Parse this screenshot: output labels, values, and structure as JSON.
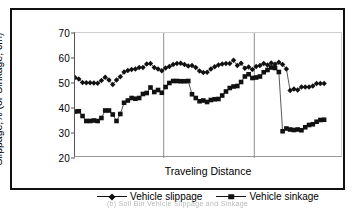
{
  "chart_data": {
    "type": "line",
    "title": "",
    "xlabel": "Traveling Distance",
    "ylabel": "Slippage,% (or Sinkage, cm)",
    "ylim": [
      20,
      70
    ],
    "yticks": [
      20,
      30,
      40,
      50,
      60,
      70
    ],
    "xlim": [
      0,
      71
    ],
    "xticks": [],
    "grid": false,
    "legend_position": "bottom-center",
    "vertical_dividers": [
      23.5,
      47.5
    ],
    "series": [
      {
        "name": "Vehicle slippage",
        "marker": "diamond",
        "color": "#111111",
        "values": [
          52.2,
          51.6,
          50.2,
          50.1,
          50.1,
          50.0,
          49.9,
          51.0,
          52.3,
          51.2,
          49.4,
          51.2,
          52.5,
          54.4,
          55.0,
          55.4,
          55.6,
          56.2,
          56.2,
          57.6,
          57.8,
          56.2,
          55.6,
          54.9,
          56.0,
          56.6,
          57.4,
          57.8,
          57.9,
          57.4,
          56.8,
          57.0,
          56.2,
          54.8,
          54.2,
          54.3,
          55.6,
          56.5,
          57.2,
          57.6,
          57.8,
          57.8,
          59.1,
          57.0,
          57.9,
          55.9,
          56.4,
          55.4,
          56.6,
          57.0,
          57.8,
          57.2,
          58.0,
          57.5,
          58.3,
          57.4,
          55.6,
          47.0,
          47.6,
          47.2,
          48.4,
          48.4,
          48.4,
          48.8,
          49.8,
          49.8,
          49.8
        ],
        "labels": []
      },
      {
        "name": "Vehicle sinkage",
        "marker": "square",
        "color": "#111111",
        "values": [
          38.6,
          38.7,
          36.8,
          34.8,
          34.8,
          35.0,
          34.8,
          36.0,
          39.0,
          39.0,
          37.4,
          34.8,
          37.6,
          42.1,
          43.0,
          44.0,
          43.7,
          44.0,
          45.6,
          46.0,
          48.2,
          46.4,
          47.2,
          46.1,
          48.4,
          50.0,
          50.8,
          50.8,
          50.7,
          50.7,
          50.8,
          45.5,
          44.0,
          42.7,
          43.0,
          42.4,
          43.2,
          43.5,
          43.6,
          45.0,
          46.6,
          48.0,
          48.6,
          48.8,
          50.4,
          52.6,
          53.5,
          52.0,
          52.2,
          52.6,
          54.3,
          55.2,
          56.2,
          56.0,
          54.4,
          30.7,
          31.8,
          31.4,
          31.2,
          31.4,
          31.1,
          32.3,
          33.2,
          33.5,
          34.5,
          35.2,
          35.3
        ],
        "labels": []
      }
    ]
  },
  "axis": {
    "y_ticks": [
      "70",
      "60",
      "50",
      "40",
      "30",
      "20"
    ],
    "y_title": "Slippage,% (or Sinkage, cm)",
    "x_title": "Traveling Distance"
  },
  "legend": {
    "items": [
      {
        "label": "Vehicle slippage",
        "marker": "diamond"
      },
      {
        "label": "Vehicle sinkage",
        "marker": "square"
      }
    ]
  },
  "caption": {
    "text": "(b) Soil Bin Vehicle Slippage and Sinkage"
  }
}
